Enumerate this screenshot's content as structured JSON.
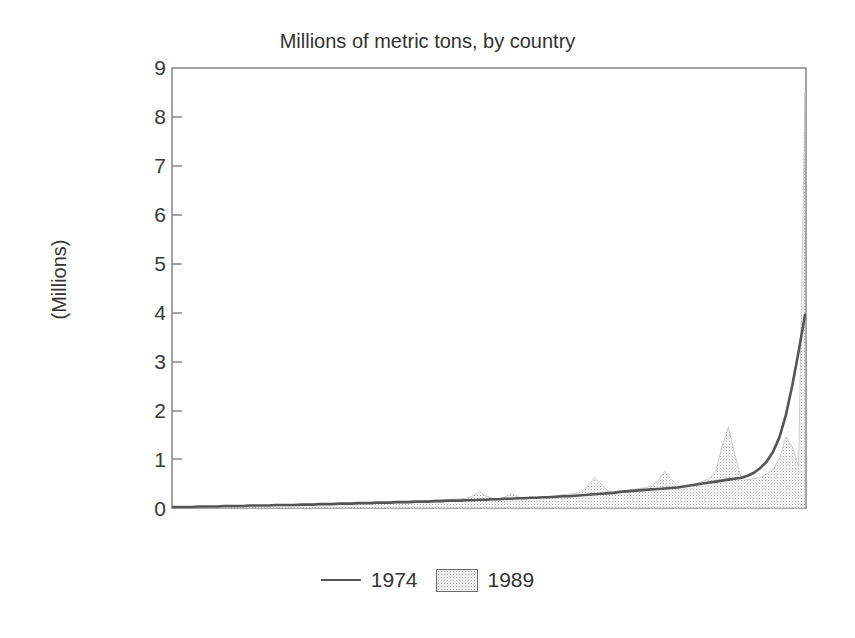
{
  "chart_data": {
    "type": "area",
    "title": "Millions of metric tons, by country",
    "xlabel": "",
    "ylabel": "(Millions)",
    "ylim": [
      0,
      9
    ],
    "yticks": [
      "0",
      "1",
      "2",
      "3",
      "4",
      "5",
      "6",
      "7",
      "8",
      "9"
    ],
    "grid": false,
    "xaxis_ticks_visible": false,
    "legend_position": "bottom-center",
    "legend": [
      {
        "name": "1974",
        "style": "line",
        "color": "#555555"
      },
      {
        "name": "1989",
        "style": "filled-area",
        "color": "#c9c9c9"
      }
    ],
    "x": [
      1,
      2,
      3,
      4,
      5,
      6,
      7,
      8,
      9,
      10,
      11,
      12,
      13,
      14,
      15,
      16,
      17,
      18,
      19,
      20,
      21,
      22,
      23,
      24,
      25,
      26,
      27,
      28,
      29,
      30,
      31,
      32,
      33,
      34,
      35,
      36,
      37,
      38,
      39,
      40,
      41,
      42,
      43,
      44,
      45,
      46,
      47,
      48,
      49,
      50,
      51,
      52,
      53,
      54,
      55,
      56,
      57,
      58,
      59,
      60,
      61,
      62,
      63,
      64,
      65,
      66,
      67,
      68,
      69,
      70,
      71,
      72,
      73,
      74,
      75,
      76,
      77,
      78,
      79,
      80,
      81,
      82,
      83,
      84,
      85,
      86,
      87,
      88,
      89,
      90,
      91,
      92,
      93,
      94,
      95,
      96,
      97,
      98,
      99,
      100
    ],
    "series": [
      {
        "name": "1989",
        "style": "filled-area",
        "values": [
          0.01,
          0.01,
          0.01,
          0.01,
          0.02,
          0.02,
          0.02,
          0.02,
          0.03,
          0.03,
          0.03,
          0.04,
          0.04,
          0.04,
          0.05,
          0.05,
          0.05,
          0.06,
          0.06,
          0.06,
          0.07,
          0.07,
          0.08,
          0.08,
          0.09,
          0.09,
          0.09,
          0.1,
          0.1,
          0.1,
          0.11,
          0.11,
          0.11,
          0.12,
          0.12,
          0.13,
          0.13,
          0.14,
          0.14,
          0.15,
          0.15,
          0.16,
          0.17,
          0.17,
          0.18,
          0.19,
          0.2,
          0.25,
          0.33,
          0.25,
          0.2,
          0.19,
          0.22,
          0.3,
          0.23,
          0.2,
          0.21,
          0.22,
          0.23,
          0.24,
          0.25,
          0.27,
          0.28,
          0.3,
          0.33,
          0.45,
          0.62,
          0.5,
          0.36,
          0.33,
          0.34,
          0.36,
          0.38,
          0.4,
          0.42,
          0.45,
          0.55,
          0.75,
          0.6,
          0.45,
          0.44,
          0.46,
          0.5,
          0.55,
          0.6,
          0.75,
          1.25,
          1.66,
          1.1,
          0.62,
          0.58,
          0.6,
          0.62,
          0.7,
          0.8,
          1.0,
          1.45,
          1.25,
          0.85,
          8.5
        ]
      },
      {
        "name": "1974",
        "style": "line",
        "values": [
          0.02,
          0.02,
          0.02,
          0.02,
          0.03,
          0.03,
          0.03,
          0.03,
          0.04,
          0.04,
          0.04,
          0.04,
          0.05,
          0.05,
          0.05,
          0.05,
          0.06,
          0.06,
          0.06,
          0.06,
          0.07,
          0.07,
          0.07,
          0.08,
          0.08,
          0.08,
          0.09,
          0.09,
          0.09,
          0.1,
          0.1,
          0.1,
          0.11,
          0.11,
          0.11,
          0.12,
          0.12,
          0.12,
          0.13,
          0.13,
          0.13,
          0.14,
          0.14,
          0.15,
          0.15,
          0.15,
          0.16,
          0.16,
          0.17,
          0.17,
          0.18,
          0.18,
          0.19,
          0.19,
          0.2,
          0.2,
          0.21,
          0.21,
          0.22,
          0.22,
          0.23,
          0.24,
          0.24,
          0.25,
          0.26,
          0.27,
          0.28,
          0.29,
          0.3,
          0.31,
          0.33,
          0.34,
          0.35,
          0.36,
          0.37,
          0.38,
          0.39,
          0.4,
          0.41,
          0.42,
          0.44,
          0.46,
          0.48,
          0.5,
          0.52,
          0.54,
          0.56,
          0.58,
          0.6,
          0.62,
          0.66,
          0.72,
          0.82,
          0.95,
          1.15,
          1.45,
          1.9,
          2.5,
          3.2,
          3.95
        ]
      }
    ]
  },
  "axis": {
    "title": "Millions of metric tons, by country",
    "ylabel": "(Millions)",
    "ytick_0": "0",
    "ytick_1": "1",
    "ytick_2": "2",
    "ytick_3": "3",
    "ytick_4": "4",
    "ytick_5": "5",
    "ytick_6": "6",
    "ytick_7": "7",
    "ytick_8": "8",
    "ytick_9": "9"
  },
  "legend": {
    "entry_line_label": "1974",
    "entry_area_label": "1989"
  },
  "colors": {
    "line": "#555555",
    "area_fill": "#d2d2d2",
    "frame": "#8d8d8d",
    "text": "#333333",
    "background": "#ffffff"
  }
}
